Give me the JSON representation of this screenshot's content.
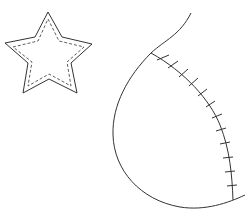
{
  "canvas": {
    "width": 245,
    "height": 220,
    "background": "#ffffff"
  },
  "colors": {
    "stroke": "#333333"
  },
  "star": {
    "outline_points": "48,12 62,37 92,44 71,63 77,93 49,79 23,93 28,63 5,43 35,37",
    "stitch_points": "48,19 59,41 84,47 67,62 71,86 49,74 28,86 32,62 13,47 38,41",
    "stitch_dash": "3,2"
  },
  "curve": {
    "outer_path": "M191,13 C180,35 165,40 151,53 C128,76 112,105 113,135 C114,170 140,200 180,207 C205,211 228,203 245,195",
    "seam_path": "M151,53 C185,72 210,100 220,125 C230,150 232,175 233,200",
    "ticks": [
      [
        157,
        60,
        169,
        55
      ],
      [
        168,
        68,
        178,
        61
      ],
      [
        179,
        77,
        188,
        69
      ],
      [
        189,
        86,
        198,
        78
      ],
      [
        198,
        96,
        207,
        89
      ],
      [
        206,
        107,
        215,
        101
      ],
      [
        212,
        118,
        222,
        114
      ],
      [
        216,
        131,
        226,
        128
      ],
      [
        220,
        144,
        230,
        142
      ],
      [
        223,
        158,
        233,
        157
      ],
      [
        225,
        172,
        235,
        171
      ],
      [
        227,
        186,
        237,
        185
      ]
    ]
  }
}
